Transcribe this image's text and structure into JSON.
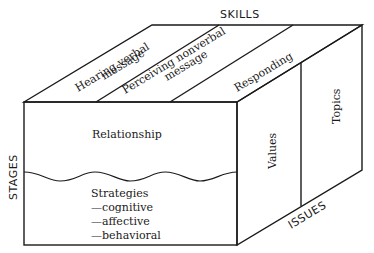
{
  "diagram": {
    "type": "3d-box-model",
    "axes": {
      "top": "SKILLS",
      "left": "STAGES",
      "right_bottom": "ISSUES"
    },
    "top_face": {
      "sections": [
        {
          "line1": "Hearing verbal",
          "line2": "message"
        },
        {
          "line1": "Perceiving nonverbal",
          "line2": "message"
        },
        {
          "line1": "Responding",
          "line2": ""
        }
      ]
    },
    "front_face": {
      "upper": "Relationship",
      "lower": {
        "title": "Strategies",
        "items": [
          "—cognitive",
          "—affective",
          "—behavioral"
        ]
      }
    },
    "side_face": {
      "sections": [
        "Values",
        "Topics"
      ]
    },
    "colors": {
      "line": "#1a1a1a",
      "background": "#ffffff"
    }
  }
}
